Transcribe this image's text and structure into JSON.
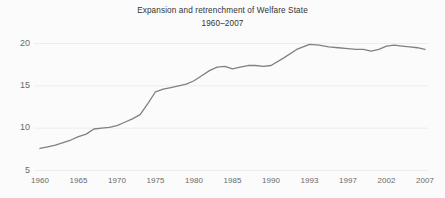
{
  "chart_data": {
    "type": "line",
    "title": "Expansion and retrenchment of Welfare State",
    "subtitle": "1960–2007",
    "xlabel": "",
    "ylabel": "",
    "grid": "horizontal",
    "legend": "none",
    "line_color": "#808080",
    "background_color": "#fbfbfb",
    "axis_label_color": "#6a6a6a",
    "ylim": [
      5,
      20
    ],
    "yticks": [
      5,
      10,
      15,
      20
    ],
    "ytick_labels": [
      "5",
      "10",
      "15",
      "20"
    ],
    "xtick_labels": [
      "1960",
      "1965",
      "1970",
      "1975",
      "1980",
      "1985",
      "1990",
      "1993",
      "1997",
      "2002",
      "2007"
    ],
    "x": [
      1960,
      1961,
      1962,
      1963,
      1964,
      1965,
      1966,
      1967,
      1968,
      1969,
      1970,
      1971,
      1972,
      1973,
      1974,
      1975,
      1976,
      1977,
      1978,
      1979,
      1980,
      1981,
      1982,
      1983,
      1984,
      1985,
      1986,
      1987,
      1988,
      1989,
      1990,
      1991,
      1992,
      1993,
      1994,
      1995,
      1996,
      1997,
      1998,
      1999,
      2000,
      2001,
      2002,
      2003,
      2004,
      2005,
      2006,
      2007
    ],
    "values": [
      7.6,
      7.8,
      8.0,
      8.3,
      8.6,
      9.0,
      9.3,
      9.9,
      10.0,
      10.1,
      10.3,
      10.7,
      11.1,
      11.6,
      12.9,
      14.3,
      14.6,
      14.8,
      15.0,
      15.2,
      15.6,
      16.2,
      16.8,
      17.2,
      17.3,
      17.0,
      17.2,
      17.4,
      17.4,
      17.3,
      17.4,
      18.3,
      19.3,
      19.9,
      19.8,
      19.6,
      19.5,
      19.4,
      19.3,
      19.3,
      19.1,
      19.3,
      19.7,
      19.8,
      19.7,
      19.6,
      19.5,
      19.3
    ]
  }
}
